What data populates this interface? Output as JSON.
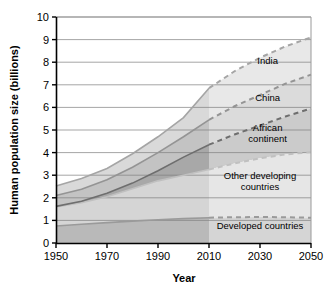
{
  "chart_data": {
    "type": "area",
    "title": "",
    "subtitle": "",
    "xlabel": "Year",
    "ylabel": "Human population size (billions)",
    "xlim": [
      1950,
      2050
    ],
    "ylim": [
      0,
      10
    ],
    "grid": true,
    "gridlines_axis": "y",
    "legend_position": "inline-right",
    "projection_start": 2010,
    "projection_note": "Dashed lines to the right of 2010 indicate projections",
    "x_ticks": [
      1950,
      1970,
      1990,
      2010,
      2030,
      2050
    ],
    "x_tick_labels": [
      "1950",
      "1970",
      "1990",
      "2010",
      "2030",
      "2050"
    ],
    "y_ticks": [
      0,
      1,
      2,
      3,
      4,
      5,
      6,
      7,
      8,
      9,
      10
    ],
    "y_tick_labels": [
      "0",
      "1",
      "2",
      "3",
      "4",
      "5",
      "6",
      "7",
      "8",
      "9",
      "10"
    ],
    "stacking": "cumulative-from-bottom",
    "x": [
      1950,
      1960,
      1970,
      1980,
      1990,
      2000,
      2010,
      2020,
      2030,
      2040,
      2050
    ],
    "series": [
      {
        "name": "Developed countries",
        "label": "Developed countries",
        "order": 1,
        "fill": "#b9b9b9",
        "line": "#9a9a9a",
        "cumulative_values": [
          0.75,
          0.83,
          0.9,
          0.97,
          1.03,
          1.08,
          1.12,
          1.14,
          1.15,
          1.14,
          1.12
        ],
        "value_1950": 0.75,
        "value_2010": 1.12,
        "value_2050": 1.12
      },
      {
        "name": "Other developing countries",
        "label": "Other developing countries",
        "order": 2,
        "fill": "#d5d5d5",
        "line": "#c0c0c0",
        "cumulative_values": [
          1.6,
          1.78,
          2.05,
          2.4,
          2.75,
          3.0,
          3.25,
          3.52,
          3.75,
          3.92,
          4.02
        ],
        "value_1950": 1.6,
        "value_2010": 3.25,
        "value_2050": 4.02
      },
      {
        "name": "African continent",
        "label": "African continent",
        "order": 3,
        "fill": "#a8a8a8",
        "line": "#6e6e6e",
        "cumulative_values": [
          1.62,
          1.85,
          2.2,
          2.65,
          3.2,
          3.8,
          4.35,
          4.8,
          5.2,
          5.6,
          5.95
        ],
        "value_1950": 1.62,
        "value_2010": 4.35,
        "value_2050": 5.95
      },
      {
        "name": "China",
        "label": "China",
        "order": 4,
        "fill": "#c3c3c3",
        "line": "#949494",
        "cumulative_values": [
          2.1,
          2.38,
          2.8,
          3.35,
          4.0,
          4.7,
          5.45,
          6.05,
          6.55,
          7.05,
          7.45
        ],
        "value_1950": 2.1,
        "value_2010": 5.45,
        "value_2050": 7.45
      },
      {
        "name": "India",
        "label": "India",
        "order": 5,
        "fill": "#d9d9d9",
        "line": "#a5a5a5",
        "cumulative_values": [
          2.52,
          2.85,
          3.3,
          3.95,
          4.7,
          5.55,
          6.85,
          7.6,
          8.2,
          8.7,
          9.1
        ],
        "value_1950": 2.52,
        "value_2010": 6.85,
        "value_2050": 9.1
      }
    ],
    "annotations": [
      {
        "text": "India",
        "x": 2033,
        "y": 7.9
      },
      {
        "text": "China",
        "x": 2033,
        "y": 6.3
      },
      {
        "text": "African",
        "x": 2033,
        "y": 4.95
      },
      {
        "text": "continent",
        "x": 2033,
        "y": 4.45
      },
      {
        "text": "Other developing",
        "x": 2030,
        "y": 2.85
      },
      {
        "text": "countries",
        "x": 2030,
        "y": 2.35
      },
      {
        "text": "Developed countries",
        "x": 2030,
        "y": 0.6
      }
    ]
  },
  "colors": {
    "axis": "#000000",
    "gridline": "#808080",
    "background": "#ffffff",
    "text": "#000000",
    "projection_overlay": "#ffffff"
  }
}
